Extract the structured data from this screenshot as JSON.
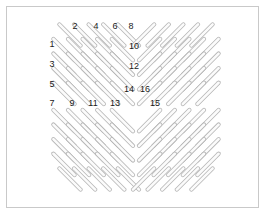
{
  "figure": {
    "background_color": "#ffffff",
    "border_color": "#c9c9c9",
    "dash_stroke_color": "#b5b5b5",
    "dash_fill_color": "#fbfbfb",
    "label_color": "#1a1a1a",
    "frame": {
      "x": 6,
      "y": 6,
      "width": 253,
      "height": 202
    }
  },
  "pattern": {
    "type": "mirrored-diagonal-dash-grid",
    "element_shape": "capsule",
    "dash_length": 30,
    "dash_thickness": 4.2,
    "spacing": 14.6,
    "center": {
      "x": 136,
      "y": 107
    },
    "quadrants": [
      {
        "name": "upper-left",
        "direction": "down-right",
        "angle_deg": 45
      },
      {
        "name": "upper-right",
        "direction": "down-left",
        "angle_deg": -45
      },
      {
        "name": "lower-left",
        "direction": "down-right",
        "angle_deg": 45
      },
      {
        "name": "lower-right",
        "direction": "down-left",
        "angle_deg": -45
      }
    ],
    "dashes": [
      {
        "cx": 70.0,
        "cy": 35.0,
        "a": 45
      },
      {
        "cx": 84.6,
        "cy": 35.0,
        "a": 45
      },
      {
        "cx": 99.2,
        "cy": 35.0,
        "a": 45
      },
      {
        "cx": 113.8,
        "cy": 35.0,
        "a": 45
      },
      {
        "cx": 128.4,
        "cy": 35.0,
        "a": 45
      },
      {
        "cx": 64.0,
        "cy": 49.6,
        "a": 45
      },
      {
        "cx": 78.6,
        "cy": 49.6,
        "a": 45
      },
      {
        "cx": 93.2,
        "cy": 49.6,
        "a": 45
      },
      {
        "cx": 107.8,
        "cy": 49.6,
        "a": 45
      },
      {
        "cx": 122.4,
        "cy": 49.6,
        "a": 45
      },
      {
        "cx": 64.0,
        "cy": 64.2,
        "a": 45
      },
      {
        "cx": 78.6,
        "cy": 64.2,
        "a": 45
      },
      {
        "cx": 93.2,
        "cy": 64.2,
        "a": 45
      },
      {
        "cx": 107.8,
        "cy": 64.2,
        "a": 45
      },
      {
        "cx": 122.4,
        "cy": 64.2,
        "a": 45
      },
      {
        "cx": 64.0,
        "cy": 78.8,
        "a": 45
      },
      {
        "cx": 78.6,
        "cy": 78.8,
        "a": 45
      },
      {
        "cx": 93.2,
        "cy": 78.8,
        "a": 45
      },
      {
        "cx": 107.8,
        "cy": 78.8,
        "a": 45
      },
      {
        "cx": 122.4,
        "cy": 78.8,
        "a": 45
      },
      {
        "cx": 64.0,
        "cy": 93.4,
        "a": 45
      },
      {
        "cx": 78.6,
        "cy": 93.4,
        "a": 45
      },
      {
        "cx": 93.2,
        "cy": 93.4,
        "a": 45
      },
      {
        "cx": 107.8,
        "cy": 93.4,
        "a": 45
      },
      {
        "cx": 122.4,
        "cy": 93.4,
        "a": 45
      },
      {
        "cx": 143.6,
        "cy": 35.0,
        "a": -45
      },
      {
        "cx": 158.2,
        "cy": 35.0,
        "a": -45
      },
      {
        "cx": 172.8,
        "cy": 35.0,
        "a": -45
      },
      {
        "cx": 187.4,
        "cy": 35.0,
        "a": -45
      },
      {
        "cx": 202.0,
        "cy": 35.0,
        "a": -45
      },
      {
        "cx": 149.6,
        "cy": 49.6,
        "a": -45
      },
      {
        "cx": 164.2,
        "cy": 49.6,
        "a": -45
      },
      {
        "cx": 178.8,
        "cy": 49.6,
        "a": -45
      },
      {
        "cx": 193.4,
        "cy": 49.6,
        "a": -45
      },
      {
        "cx": 208.0,
        "cy": 49.6,
        "a": -45
      },
      {
        "cx": 149.6,
        "cy": 64.2,
        "a": -45
      },
      {
        "cx": 164.2,
        "cy": 64.2,
        "a": -45
      },
      {
        "cx": 178.8,
        "cy": 64.2,
        "a": -45
      },
      {
        "cx": 193.4,
        "cy": 64.2,
        "a": -45
      },
      {
        "cx": 208.0,
        "cy": 64.2,
        "a": -45
      },
      {
        "cx": 149.6,
        "cy": 78.8,
        "a": -45
      },
      {
        "cx": 164.2,
        "cy": 78.8,
        "a": -45
      },
      {
        "cx": 178.8,
        "cy": 78.8,
        "a": -45
      },
      {
        "cx": 193.4,
        "cy": 78.8,
        "a": -45
      },
      {
        "cx": 208.0,
        "cy": 78.8,
        "a": -45
      },
      {
        "cx": 149.6,
        "cy": 93.4,
        "a": -45
      },
      {
        "cx": 164.2,
        "cy": 93.4,
        "a": -45
      },
      {
        "cx": 178.8,
        "cy": 93.4,
        "a": -45
      },
      {
        "cx": 193.4,
        "cy": 93.4,
        "a": -45
      },
      {
        "cx": 208.0,
        "cy": 93.4,
        "a": -45
      },
      {
        "cx": 64.0,
        "cy": 120.6,
        "a": 45
      },
      {
        "cx": 78.6,
        "cy": 120.6,
        "a": 45
      },
      {
        "cx": 93.2,
        "cy": 120.6,
        "a": 45
      },
      {
        "cx": 107.8,
        "cy": 120.6,
        "a": 45
      },
      {
        "cx": 122.4,
        "cy": 120.6,
        "a": 45
      },
      {
        "cx": 64.0,
        "cy": 135.2,
        "a": 45
      },
      {
        "cx": 78.6,
        "cy": 135.2,
        "a": 45
      },
      {
        "cx": 93.2,
        "cy": 135.2,
        "a": 45
      },
      {
        "cx": 107.8,
        "cy": 135.2,
        "a": 45
      },
      {
        "cx": 122.4,
        "cy": 135.2,
        "a": 45
      },
      {
        "cx": 64.0,
        "cy": 149.8,
        "a": 45
      },
      {
        "cx": 78.6,
        "cy": 149.8,
        "a": 45
      },
      {
        "cx": 93.2,
        "cy": 149.8,
        "a": 45
      },
      {
        "cx": 107.8,
        "cy": 149.8,
        "a": 45
      },
      {
        "cx": 122.4,
        "cy": 149.8,
        "a": 45
      },
      {
        "cx": 64.0,
        "cy": 164.4,
        "a": 45
      },
      {
        "cx": 78.6,
        "cy": 164.4,
        "a": 45
      },
      {
        "cx": 93.2,
        "cy": 164.4,
        "a": 45
      },
      {
        "cx": 107.8,
        "cy": 164.4,
        "a": 45
      },
      {
        "cx": 122.4,
        "cy": 164.4,
        "a": 45
      },
      {
        "cx": 70.0,
        "cy": 179.0,
        "a": 45
      },
      {
        "cx": 84.6,
        "cy": 179.0,
        "a": 45
      },
      {
        "cx": 99.2,
        "cy": 179.0,
        "a": 45
      },
      {
        "cx": 113.8,
        "cy": 179.0,
        "a": 45
      },
      {
        "cx": 128.4,
        "cy": 179.0,
        "a": 45
      },
      {
        "cx": 149.6,
        "cy": 120.6,
        "a": -45
      },
      {
        "cx": 164.2,
        "cy": 120.6,
        "a": -45
      },
      {
        "cx": 178.8,
        "cy": 120.6,
        "a": -45
      },
      {
        "cx": 193.4,
        "cy": 120.6,
        "a": -45
      },
      {
        "cx": 208.0,
        "cy": 120.6,
        "a": -45
      },
      {
        "cx": 149.6,
        "cy": 135.2,
        "a": -45
      },
      {
        "cx": 164.2,
        "cy": 135.2,
        "a": -45
      },
      {
        "cx": 178.8,
        "cy": 135.2,
        "a": -45
      },
      {
        "cx": 193.4,
        "cy": 135.2,
        "a": -45
      },
      {
        "cx": 208.0,
        "cy": 135.2,
        "a": -45
      },
      {
        "cx": 149.6,
        "cy": 149.8,
        "a": -45
      },
      {
        "cx": 164.2,
        "cy": 149.8,
        "a": -45
      },
      {
        "cx": 178.8,
        "cy": 149.8,
        "a": -45
      },
      {
        "cx": 193.4,
        "cy": 149.8,
        "a": -45
      },
      {
        "cx": 208.0,
        "cy": 149.8,
        "a": -45
      },
      {
        "cx": 149.6,
        "cy": 164.4,
        "a": -45
      },
      {
        "cx": 164.2,
        "cy": 164.4,
        "a": -45
      },
      {
        "cx": 178.8,
        "cy": 164.4,
        "a": -45
      },
      {
        "cx": 193.4,
        "cy": 164.4,
        "a": -45
      },
      {
        "cx": 208.0,
        "cy": 164.4,
        "a": -45
      },
      {
        "cx": 143.6,
        "cy": 179.0,
        "a": -45
      },
      {
        "cx": 158.2,
        "cy": 179.0,
        "a": -45
      },
      {
        "cx": 172.8,
        "cy": 179.0,
        "a": -45
      },
      {
        "cx": 187.4,
        "cy": 179.0,
        "a": -45
      },
      {
        "cx": 202.0,
        "cy": 179.0,
        "a": -45
      }
    ]
  },
  "labels": [
    {
      "id": 1,
      "text": "1",
      "x": 52,
      "y": 44
    },
    {
      "id": 2,
      "text": "2",
      "x": 75,
      "y": 26
    },
    {
      "id": 3,
      "text": "3",
      "x": 52,
      "y": 64
    },
    {
      "id": 4,
      "text": "4",
      "x": 96,
      "y": 26
    },
    {
      "id": 5,
      "text": "5",
      "x": 52,
      "y": 84
    },
    {
      "id": 6,
      "text": "6",
      "x": 115,
      "y": 26
    },
    {
      "id": 7,
      "text": "7",
      "x": 52,
      "y": 103
    },
    {
      "id": 8,
      "text": "8",
      "x": 131,
      "y": 26
    },
    {
      "id": 9,
      "text": "9",
      "x": 72,
      "y": 103
    },
    {
      "id": 10,
      "text": "10",
      "x": 134,
      "y": 46
    },
    {
      "id": 11,
      "text": "11",
      "x": 93,
      "y": 103
    },
    {
      "id": 12,
      "text": "12",
      "x": 134,
      "y": 66
    },
    {
      "id": 13,
      "text": "13",
      "x": 115,
      "y": 103
    },
    {
      "id": 14,
      "text": "14",
      "x": 129,
      "y": 89
    },
    {
      "id": 15,
      "text": "15",
      "x": 155,
      "y": 103
    },
    {
      "id": 16,
      "text": "16",
      "x": 145,
      "y": 89
    }
  ]
}
